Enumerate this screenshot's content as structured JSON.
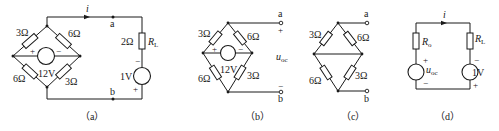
{
  "figures": [
    {
      "id": "a",
      "caption": "（a）",
      "labels": {
        "current": "i",
        "node_a": "a",
        "node_b": "b",
        "r_top_left": "3Ω",
        "r_top_right": "6Ω",
        "r_bottom_left": "6Ω",
        "r_bottom_right": "3Ω",
        "source_voltage": "12V",
        "source_plus": "+",
        "source_minus": "−",
        "rl_value": "2Ω",
        "rl_symbol": "R",
        "rl_sub": "L",
        "load_source": "1V",
        "load_minus": "−",
        "load_plus": "+"
      }
    },
    {
      "id": "b",
      "caption": "（b）",
      "labels": {
        "node_a": "a",
        "node_b": "b",
        "term_plus": "+",
        "term_minus": "−",
        "voc_symbol": "u",
        "voc_sub": "oc",
        "r_top_left": "3Ω",
        "r_top_right": "6Ω",
        "r_bottom_left": "6Ω",
        "r_bottom_right": "3Ω",
        "source_voltage": "12V",
        "source_plus": "+",
        "source_minus": "−"
      }
    },
    {
      "id": "c",
      "caption": "（c）",
      "labels": {
        "node_a": "a",
        "node_b": "b",
        "r_top_left": "3Ω",
        "r_top_right": "6Ω",
        "r_bottom_left": "6Ω",
        "r_bottom_right": "3Ω"
      }
    },
    {
      "id": "d",
      "caption": "（d）",
      "labels": {
        "current": "i",
        "ro_symbol": "R",
        "ro_sub": "o",
        "voc_symbol": "u",
        "voc_sub": "oc",
        "voc_plus": "+",
        "voc_minus": "−",
        "rl_symbol": "R",
        "rl_sub": "L",
        "load_source": "1V",
        "load_minus": "−",
        "load_plus": "+"
      }
    }
  ]
}
